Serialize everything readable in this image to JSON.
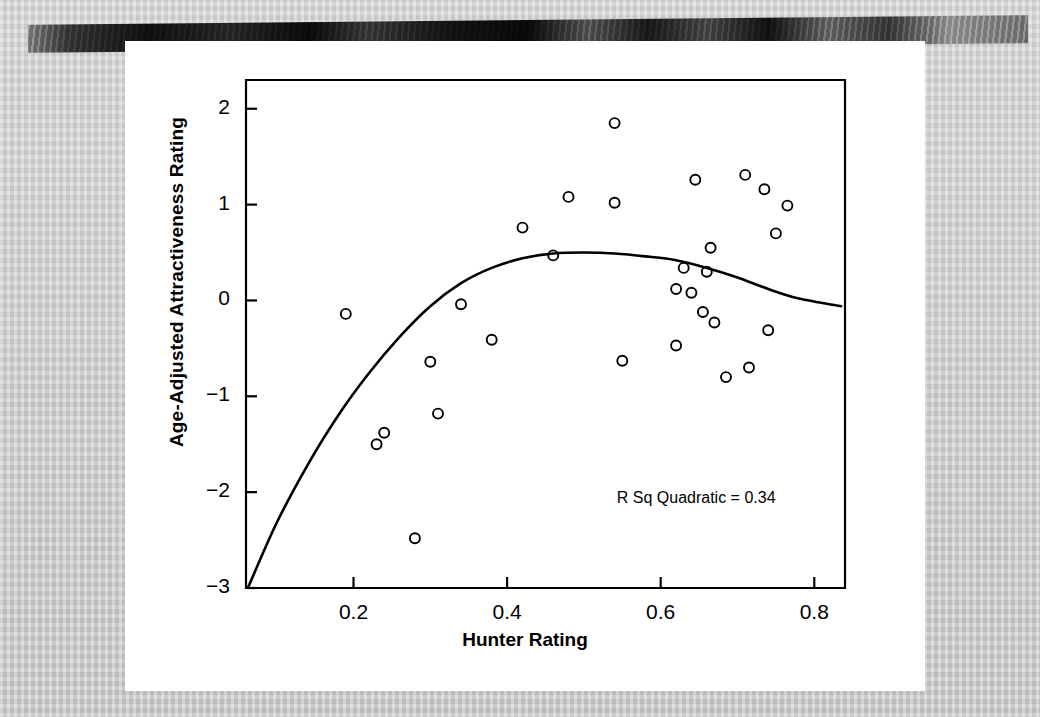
{
  "figure": {
    "kind": "scatter-with-quadratic-fit",
    "background_color": "#ffffff",
    "page_background_color": "#c9c9c9",
    "ink_color": "#000000"
  },
  "chart_data": {
    "type": "scatter",
    "title": "",
    "xlabel": "Hunter Rating",
    "ylabel": "Age-Adjusted Attractiveness Rating",
    "xlim": [
      0.06,
      0.84
    ],
    "ylim": [
      -3.0,
      2.3
    ],
    "xticks": [
      0.2,
      0.4,
      0.6,
      0.8
    ],
    "xtick_labels": [
      "0.2",
      "0.4",
      "0.6",
      "0.8"
    ],
    "yticks": [
      2,
      1,
      0,
      -1,
      -2,
      -3
    ],
    "ytick_labels": [
      "2",
      "1",
      "0",
      "−1",
      "−2",
      "−3"
    ],
    "grid": false,
    "legend": null,
    "marker": "open-circle",
    "annotations": [
      {
        "text": "R Sq Quadratic = 0.34",
        "x": 0.66,
        "y": -2.07
      }
    ],
    "points": [
      {
        "x": 0.19,
        "y": -0.14
      },
      {
        "x": 0.23,
        "y": -1.5
      },
      {
        "x": 0.24,
        "y": -1.38
      },
      {
        "x": 0.28,
        "y": -2.48
      },
      {
        "x": 0.3,
        "y": -0.64
      },
      {
        "x": 0.31,
        "y": -1.18
      },
      {
        "x": 0.34,
        "y": -0.04
      },
      {
        "x": 0.38,
        "y": -0.41
      },
      {
        "x": 0.42,
        "y": 0.76
      },
      {
        "x": 0.46,
        "y": 0.47
      },
      {
        "x": 0.48,
        "y": 1.08
      },
      {
        "x": 0.54,
        "y": 1.85
      },
      {
        "x": 0.54,
        "y": 1.02
      },
      {
        "x": 0.55,
        "y": -0.63
      },
      {
        "x": 0.62,
        "y": 0.12
      },
      {
        "x": 0.62,
        "y": -0.47
      },
      {
        "x": 0.63,
        "y": 0.34
      },
      {
        "x": 0.64,
        "y": 0.08
      },
      {
        "x": 0.645,
        "y": 1.26
      },
      {
        "x": 0.655,
        "y": -0.12
      },
      {
        "x": 0.66,
        "y": 0.3
      },
      {
        "x": 0.665,
        "y": 0.55
      },
      {
        "x": 0.67,
        "y": -0.23
      },
      {
        "x": 0.685,
        "y": -0.8
      },
      {
        "x": 0.71,
        "y": 1.31
      },
      {
        "x": 0.715,
        "y": -0.7
      },
      {
        "x": 0.735,
        "y": 1.16
      },
      {
        "x": 0.74,
        "y": -0.31
      },
      {
        "x": 0.75,
        "y": 0.7
      },
      {
        "x": 0.765,
        "y": 0.99
      }
    ],
    "fit": {
      "kind": "quadratic",
      "r_squared": 0.34,
      "label": "R Sq Quadratic = 0.34",
      "curve": [
        {
          "x": 0.063,
          "y": -2.99
        },
        {
          "x": 0.1,
          "y": -2.32
        },
        {
          "x": 0.14,
          "y": -1.72
        },
        {
          "x": 0.18,
          "y": -1.2
        },
        {
          "x": 0.22,
          "y": -0.76
        },
        {
          "x": 0.26,
          "y": -0.38
        },
        {
          "x": 0.3,
          "y": -0.06
        },
        {
          "x": 0.34,
          "y": 0.18
        },
        {
          "x": 0.38,
          "y": 0.34
        },
        {
          "x": 0.42,
          "y": 0.44
        },
        {
          "x": 0.46,
          "y": 0.49
        },
        {
          "x": 0.5,
          "y": 0.5
        },
        {
          "x": 0.54,
          "y": 0.49
        },
        {
          "x": 0.58,
          "y": 0.46
        },
        {
          "x": 0.62,
          "y": 0.42
        },
        {
          "x": 0.66,
          "y": 0.34
        },
        {
          "x": 0.7,
          "y": 0.24
        },
        {
          "x": 0.74,
          "y": 0.12
        },
        {
          "x": 0.78,
          "y": 0.02
        },
        {
          "x": 0.835,
          "y": -0.06
        }
      ]
    }
  }
}
